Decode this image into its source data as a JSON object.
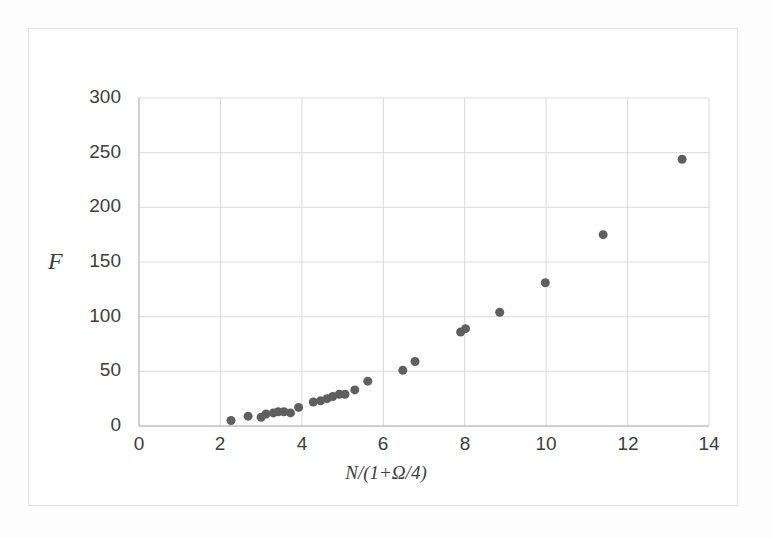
{
  "chart_data": {
    "type": "scatter",
    "title": "",
    "xlabel": "N/(1+Ω/4)",
    "ylabel": "F",
    "xlim": [
      0,
      14
    ],
    "ylim": [
      0,
      300
    ],
    "xticks": [
      0,
      2,
      4,
      6,
      8,
      10,
      12,
      14
    ],
    "yticks": [
      0,
      50,
      100,
      150,
      200,
      250,
      300
    ],
    "grid": true,
    "legend": false,
    "marker_color": "#5f5f5f",
    "marker_size": 9,
    "series": [
      {
        "name": "F vs N/(1+Ω/4)",
        "points": [
          [
            2.26,
            5
          ],
          [
            2.68,
            9
          ],
          [
            3.0,
            8
          ],
          [
            3.12,
            11
          ],
          [
            3.3,
            12
          ],
          [
            3.42,
            13
          ],
          [
            3.56,
            13
          ],
          [
            3.72,
            12
          ],
          [
            3.92,
            17
          ],
          [
            4.28,
            22
          ],
          [
            4.46,
            23
          ],
          [
            4.62,
            25
          ],
          [
            4.76,
            27
          ],
          [
            4.92,
            29
          ],
          [
            5.06,
            29
          ],
          [
            5.3,
            33
          ],
          [
            5.62,
            41
          ],
          [
            6.48,
            51
          ],
          [
            6.78,
            59
          ],
          [
            7.9,
            86
          ],
          [
            8.02,
            89
          ],
          [
            8.86,
            104
          ],
          [
            9.98,
            131
          ],
          [
            11.4,
            175
          ],
          [
            13.34,
            244
          ]
        ]
      }
    ]
  },
  "axes": {
    "y_tick_labels": [
      "300",
      "250",
      "200",
      "150",
      "100",
      "50",
      "0"
    ],
    "x_tick_labels": [
      "0",
      "2",
      "4",
      "6",
      "8",
      "10",
      "12",
      "14"
    ],
    "x_title": "N/(1+Ω/4)",
    "y_title": "F"
  },
  "colors": {
    "marker": "#5f5f5f",
    "gridline": "#d9d9d9",
    "axis_line": "#bfbfbf",
    "frame": "#e3e3e3",
    "text": "#3d3d3d",
    "background": "#ffffff"
  }
}
